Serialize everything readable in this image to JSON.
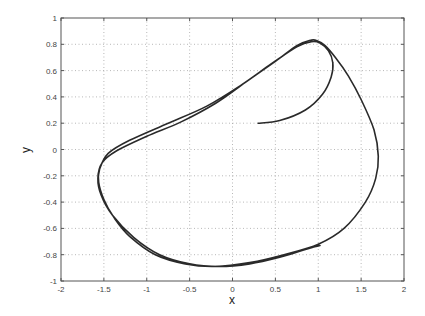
{
  "chart_data": {
    "type": "line",
    "title": "",
    "xlabel": "x",
    "ylabel": "y",
    "xlim": [
      -2,
      2
    ],
    "ylim": [
      -1,
      1
    ],
    "grid": true,
    "legend": null,
    "xticks": [
      "-2",
      "-1.5",
      "-1",
      "-0.5",
      "0",
      "0.5",
      "1",
      "1.5",
      "2"
    ],
    "yticks": [
      "-1",
      "-0.8",
      "-0.6",
      "-0.4",
      "-0.2",
      "0",
      "0.2",
      "0.4",
      "0.6",
      "0.8",
      "1"
    ],
    "series": [
      {
        "name": "phase trajectory (limit cycle)",
        "color": "#2a2a2a",
        "x": [
          0.3,
          0.55,
          0.85,
          1.05,
          1.15,
          1.17,
          1.12,
          1.02,
          0.92,
          0.75,
          0.45,
          0.1,
          -0.3,
          -0.75,
          -1.2,
          -1.45,
          -1.55,
          -1.56,
          -1.5,
          -1.38,
          -1.2,
          -0.9,
          -0.55,
          -0.2,
          0.2,
          0.6,
          1.0,
          1.3,
          1.55,
          1.67,
          1.7,
          1.65,
          1.5,
          1.35,
          1.2,
          1.08,
          0.98,
          0.9,
          0.75,
          0.5,
          0.15,
          -0.2,
          -0.6,
          -1.0,
          -1.35,
          -1.52,
          -1.57,
          -1.53,
          -1.4,
          -1.15,
          -0.85,
          -0.5,
          -0.15,
          0.2,
          0.55,
          0.85,
          0.96,
          1.02
        ],
        "y": [
          0.2,
          0.22,
          0.3,
          0.42,
          0.55,
          0.66,
          0.75,
          0.81,
          0.82,
          0.78,
          0.65,
          0.49,
          0.33,
          0.2,
          0.07,
          -0.03,
          -0.15,
          -0.25,
          -0.38,
          -0.52,
          -0.66,
          -0.8,
          -0.87,
          -0.89,
          -0.86,
          -0.8,
          -0.72,
          -0.6,
          -0.4,
          -0.22,
          -0.05,
          0.15,
          0.38,
          0.56,
          0.7,
          0.79,
          0.83,
          0.83,
          0.79,
          0.67,
          0.51,
          0.35,
          0.21,
          0.1,
          -0.01,
          -0.1,
          -0.22,
          -0.35,
          -0.5,
          -0.67,
          -0.8,
          -0.87,
          -0.89,
          -0.87,
          -0.82,
          -0.76,
          -0.74,
          -0.73
        ]
      }
    ]
  },
  "plot_box": {
    "left": 61,
    "top": 18,
    "right": 404,
    "bottom": 281
  }
}
